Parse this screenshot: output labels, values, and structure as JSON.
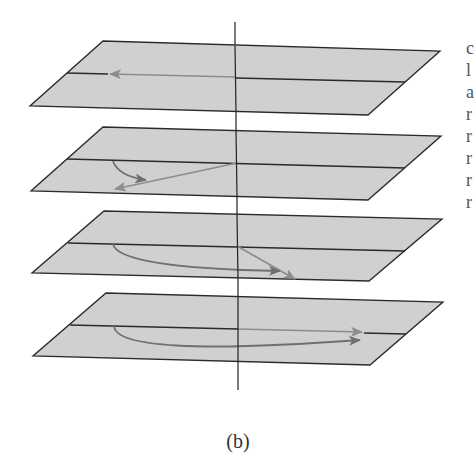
{
  "figure": {
    "caption": "(b)",
    "colors": {
      "plane_fill": "#d0d0d0",
      "plane_edge": "#2a2a2a",
      "vector": "#8c8c8c",
      "rotation_arc": "#6f6f6f",
      "axis": "#222222"
    },
    "planes": [
      {
        "index": 1,
        "vector_direction": "left along midline",
        "rotation_arc": false
      },
      {
        "index": 2,
        "vector_direction": "down-left, small rotation",
        "rotation_arc": true
      },
      {
        "index": 3,
        "vector_direction": "down-right, larger rotation",
        "rotation_arc": true
      },
      {
        "index": 4,
        "vector_direction": "right along midline, 180° rotation",
        "rotation_arc": true
      }
    ]
  },
  "edge_fragments": [
    "c",
    "l",
    "a",
    "r",
    "r",
    "r",
    "r",
    "r"
  ]
}
